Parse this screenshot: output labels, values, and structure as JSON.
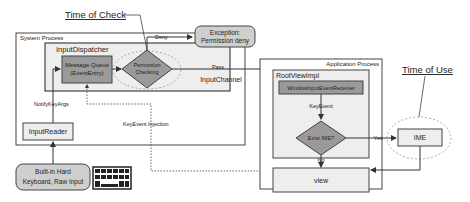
{
  "annotations": {
    "time_of_check": "Time of Check",
    "time_of_use": "Time of Use"
  },
  "system_process": {
    "label": "System Process",
    "input_dispatcher": {
      "label": "InputDispatcher",
      "message_queue": [
        "Message Queue",
        "(EventEntry)"
      ],
      "permission_checking": [
        "Permission",
        "Checking"
      ]
    },
    "input_reader": "InputReader",
    "notify_key_args": "NotifyKeyArgs"
  },
  "exception": [
    "Exception:",
    "Permission deny"
  ],
  "edges": {
    "deny": "Deny",
    "pass": "Pass",
    "input_channel": "InputChannel",
    "key_event_injection": "KeyEvent Injection",
    "key_event": "KeyEvent",
    "yes": "Yes",
    "no": "No"
  },
  "application_process": {
    "label": "Application Process",
    "root_view_impl": {
      "label": "RootViewImpl",
      "receiver": "WindowInputEventReceiver",
      "exist_ime": "Exist IME?"
    },
    "view": "view"
  },
  "ime": "IME",
  "keyboard": [
    "Built-in Hard",
    "Keyboard, Raw Input"
  ],
  "icons": {
    "keyboard": "keyboard-icon"
  },
  "colors": {
    "gray_fill": "#9a9a9a",
    "light_fill": "#eeeeee",
    "stroke": "#333333"
  }
}
